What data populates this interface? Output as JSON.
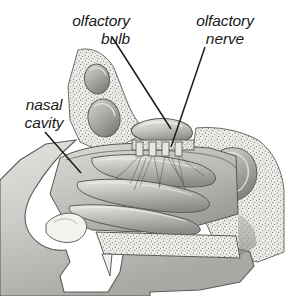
{
  "figure": {
    "title_partial": "The Sense of Smell",
    "background_color": "#ffffff",
    "ink_color": "#1a1a1a",
    "width": 288,
    "height": 296,
    "style": "grayscale pencil/airbrush medical illustration, mid-sagittal section of the human nose"
  },
  "labels": {
    "olfactory_bulb": "olfactory\nbulb",
    "olfactory_bulb_line1": "olfactory",
    "olfactory_bulb_line2": "bulb",
    "olfactory_nerve_line1": "olfactory",
    "olfactory_nerve_line2": "nerve",
    "nasal_cavity_line1": "nasal",
    "nasal_cavity_line2": "cavity"
  },
  "leader_lines": [
    {
      "name": "olfactory-bulb-leader",
      "from_x": 112,
      "from_y": 37,
      "to_x": 171,
      "to_y": 129
    },
    {
      "name": "olfactory-nerve-leader",
      "from_x": 205,
      "from_y": 47,
      "to_x": 171,
      "to_y": 147
    },
    {
      "name": "nasal-cavity-leader",
      "from_x": 45,
      "from_y": 132,
      "to_x": 81,
      "to_y": 173
    }
  ],
  "structures": [
    {
      "name": "frontal-sinus-upper",
      "description": "upper oval sinus chamber in stippled frontal bone"
    },
    {
      "name": "frontal-sinus-lower",
      "description": "lower larger oval sinus chamber"
    },
    {
      "name": "olfactory-bulb",
      "description": "elongated shaded oval above cribriform plate"
    },
    {
      "name": "cribriform-plate",
      "description": "horizontal perforated bone plate with nerve bundles"
    },
    {
      "name": "olfactory-nerve-fibers",
      "description": "fine fiber bundles descending into nasal mucosa"
    },
    {
      "name": "superior-concha",
      "description": "upper turbinate shelf"
    },
    {
      "name": "middle-concha",
      "description": "middle turbinate shelf"
    },
    {
      "name": "inferior-concha",
      "description": "lower turbinate shelf"
    },
    {
      "name": "nasal-vestibule",
      "description": "nostril opening at front of nose"
    },
    {
      "name": "hard-palate",
      "description": "stippled bony palate below nasal floor"
    },
    {
      "name": "upper-incisor",
      "description": "tooth at front of palate"
    },
    {
      "name": "sphenoid-sinus",
      "description": "kidney-shaped cavity in posterior stippled bone"
    },
    {
      "name": "nasopharynx",
      "description": "airway space behind conchae"
    },
    {
      "name": "upper-lip",
      "description": "soft tissue of lip at lower front"
    }
  ]
}
